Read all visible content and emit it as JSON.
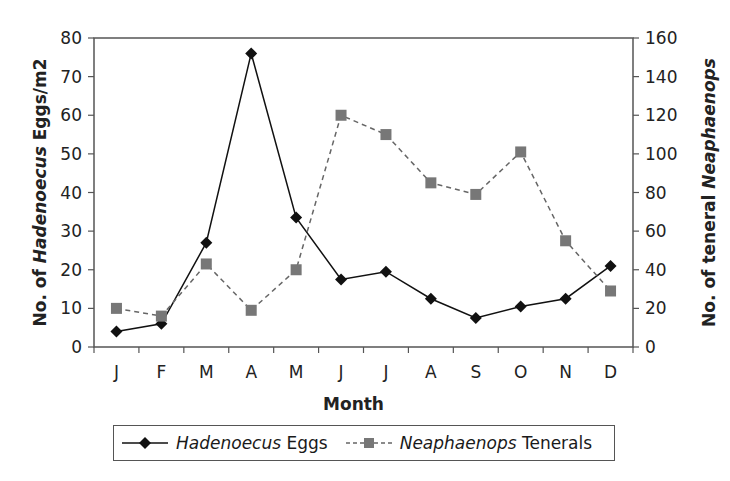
{
  "chart_data": {
    "type": "line",
    "title": "",
    "categories": [
      "J",
      "F",
      "M",
      "A",
      "M",
      "J",
      "J",
      "A",
      "S",
      "O",
      "N",
      "D"
    ],
    "xlabel": "Month",
    "ylabel": "No. of Hadenoecus Eggs/m2",
    "ylabel_parts": {
      "pre": "No. of ",
      "italic": "Hadenoecus",
      "post": " Eggs/m2"
    },
    "y2label": "No. of teneral Neaphaenops",
    "y2label_parts": {
      "pre": "No. of teneral ",
      "italic": "Neaphaenops",
      "post": ""
    },
    "ylim": [
      0,
      80
    ],
    "y2lim": [
      0,
      160
    ],
    "yticks": [
      0,
      10,
      20,
      30,
      40,
      50,
      60,
      70,
      80
    ],
    "y2ticks": [
      0,
      20,
      40,
      60,
      80,
      100,
      120,
      140,
      160
    ],
    "grid": false,
    "legend_position": "bottom",
    "series": [
      {
        "name": "Hadenoecus Eggs",
        "name_italic": "Hadenoecus",
        "name_rest": " Eggs",
        "axis": "left",
        "marker": "diamond",
        "line": "solid",
        "color": "#111111",
        "values": [
          4,
          6,
          27,
          76,
          33.5,
          17.5,
          19.5,
          12.5,
          7.5,
          10.5,
          12.5,
          21
        ]
      },
      {
        "name": "Neaphaenops Tenerals",
        "name_italic": "Neaphaenops",
        "name_rest": " Tenerals",
        "axis": "right",
        "marker": "square",
        "line": "dashed",
        "color": "#666666",
        "values": [
          20,
          16,
          43,
          19,
          40,
          120,
          110,
          85,
          79,
          101,
          55,
          29
        ]
      }
    ]
  }
}
